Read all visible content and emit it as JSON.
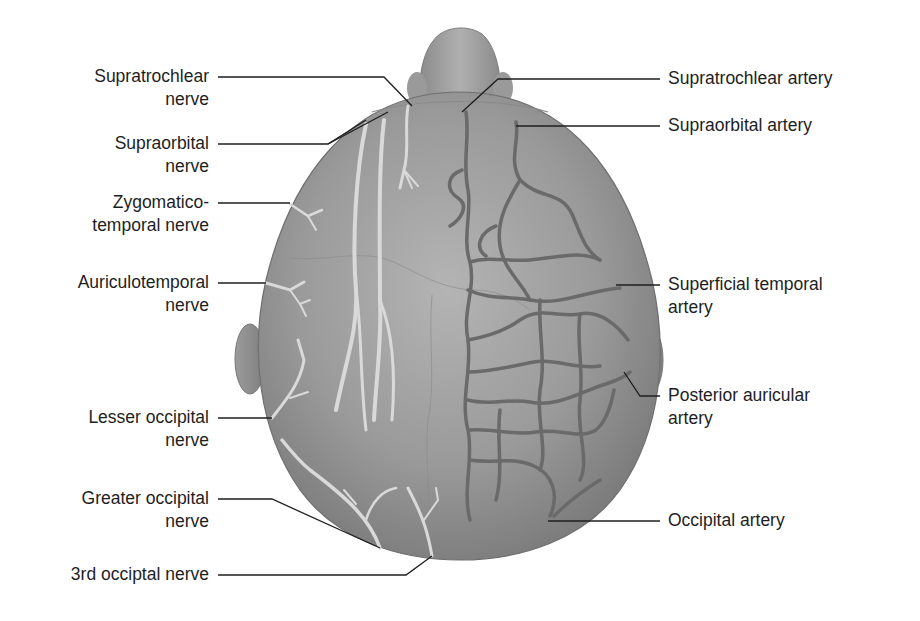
{
  "figure": {
    "colors": {
      "background": "#ffffff",
      "skin": "#8d8d8d",
      "skin_highlight": "#b5b5b5",
      "nerve": "#d8d8d8",
      "artery": "#6a6a6a",
      "leader_line": "#1e1e1e",
      "text": "#1e1e1e"
    }
  },
  "left_labels": [
    {
      "id": "supratrochlear-nerve",
      "line1": "Supratrochlear",
      "line2": "nerve"
    },
    {
      "id": "supraorbital-nerve",
      "line1": "Supraorbital",
      "line2": "nerve"
    },
    {
      "id": "zygomaticotemporal-nerve",
      "line1": "Zygomatico-",
      "line2": "temporal nerve"
    },
    {
      "id": "auriculotemporal-nerve",
      "line1": "Auriculotemporal",
      "line2": "nerve"
    },
    {
      "id": "lesser-occipital-nerve",
      "line1": "Lesser occipital",
      "line2": "nerve"
    },
    {
      "id": "greater-occipital-nerve",
      "line1": "Greater occipital",
      "line2": "nerve"
    },
    {
      "id": "third-occipital-nerve",
      "line1": "3rd occiptal nerve",
      "line2": ""
    }
  ],
  "right_labels": [
    {
      "id": "supratrochlear-artery",
      "line1": "Supratrochlear artery",
      "line2": ""
    },
    {
      "id": "supraorbital-artery",
      "line1": "Supraorbital artery",
      "line2": ""
    },
    {
      "id": "superficial-temporal-artery",
      "line1": "Superficial temporal",
      "line2": "artery"
    },
    {
      "id": "posterior-auricular-artery",
      "line1": "Posterior auricular",
      "line2": "artery"
    },
    {
      "id": "occipital-artery",
      "line1": "Occipital artery",
      "line2": ""
    }
  ]
}
